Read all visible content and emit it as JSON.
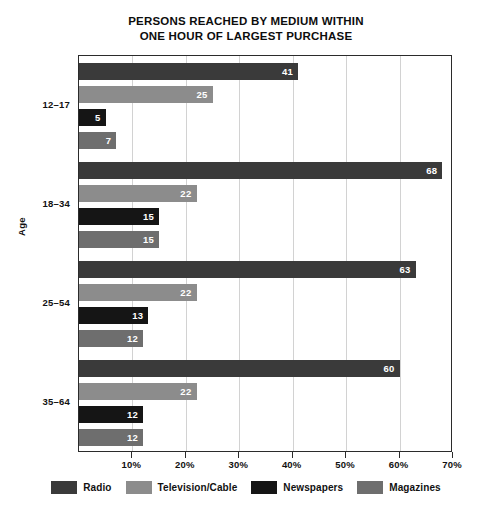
{
  "chart_data": {
    "type": "bar",
    "orientation": "horizontal",
    "title": "PERSONS REACHED BY MEDIUM WITHIN ONE HOUR OF LARGEST PURCHASE",
    "title_lines": [
      "PERSONS REACHED BY MEDIUM WITHIN",
      "ONE HOUR OF LARGEST PURCHASE"
    ],
    "xlabel": "",
    "ylabel": "Age",
    "categories": [
      "12–17",
      "18–34",
      "25–54",
      "35–64"
    ],
    "series": [
      {
        "name": "Radio",
        "color": "#3a3a3a",
        "values": [
          41,
          68,
          63,
          60
        ]
      },
      {
        "name": "Television/Cable",
        "color": "#8c8c8c",
        "values": [
          25,
          22,
          22,
          22
        ]
      },
      {
        "name": "Newspapers",
        "color": "#151515",
        "values": [
          5,
          15,
          13,
          12
        ]
      },
      {
        "name": "Magazines",
        "color": "#6e6e6e",
        "values": [
          7,
          15,
          12,
          12
        ]
      }
    ],
    "xlim": [
      0,
      70
    ],
    "xticks": [
      0,
      10,
      20,
      30,
      40,
      50,
      60,
      70
    ],
    "xtick_labels": [
      "",
      "10%",
      "20%",
      "30%",
      "40%",
      "50%",
      "60%",
      "70%"
    ],
    "value_label_suffix": "",
    "grid": "vertical",
    "legend_position": "bottom"
  }
}
